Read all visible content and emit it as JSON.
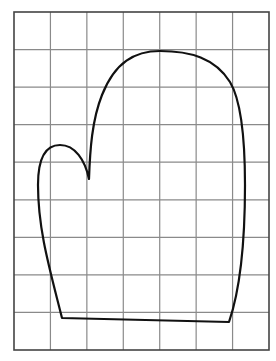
{
  "figure": {
    "type": "grid-drawing",
    "grid": {
      "columns": 7,
      "rows": 9,
      "left": 14,
      "top": 12,
      "right": 269,
      "bottom": 350,
      "line_color": "#8a8a8a",
      "border_color": "#444444"
    },
    "shape": {
      "name": "mitten",
      "stroke_color": "#111111",
      "path": "M 89 179 C 90 150, 92 120, 102 95 C 115 62, 135 51, 160 51 C 190 51, 215 58, 230 82 C 242 102, 245 140, 245 185 C 245 240, 240 290, 229 322 L 62 318 C 50 270, 38 230, 38 185 C 38 160, 45 145, 60 145 C 75 145, 85 160, 89 179 Z"
    }
  }
}
